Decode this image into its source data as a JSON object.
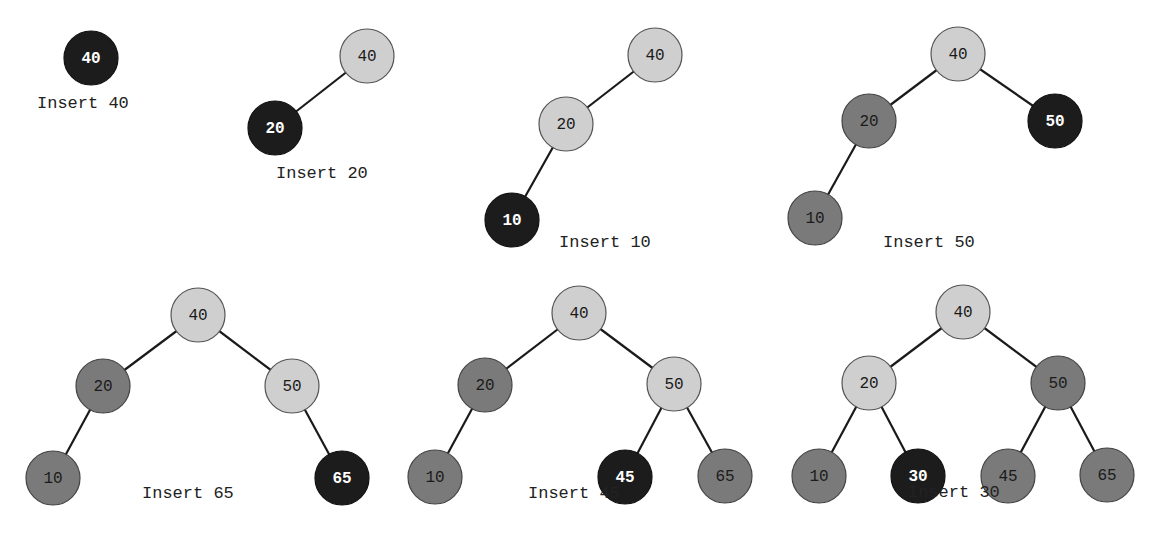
{
  "colors": {
    "new_node": "#1c1c1c",
    "balanced_node": "#cfcfcf",
    "existing_node": "#7a7a7a",
    "edge": "#1a1a1a"
  },
  "steps": [
    {
      "caption": "Insert 40",
      "caption_pos": [
        37,
        108
      ],
      "nodes": [
        {
          "v": "40",
          "x": 91,
          "y": 58,
          "s": "dark"
        }
      ],
      "edges": []
    },
    {
      "caption": "Insert 20",
      "caption_pos": [
        276,
        178
      ],
      "nodes": [
        {
          "v": "40",
          "x": 367,
          "y": 56,
          "s": "light"
        },
        {
          "v": "20",
          "x": 275,
          "y": 128,
          "s": "dark"
        }
      ],
      "edges": [
        [
          0,
          1
        ]
      ]
    },
    {
      "caption": "Insert 10",
      "caption_pos": [
        559,
        247
      ],
      "nodes": [
        {
          "v": "40",
          "x": 655,
          "y": 55,
          "s": "light"
        },
        {
          "v": "20",
          "x": 566,
          "y": 124,
          "s": "light"
        },
        {
          "v": "10",
          "x": 512,
          "y": 220,
          "s": "dark"
        }
      ],
      "edges": [
        [
          0,
          1
        ],
        [
          1,
          2
        ]
      ]
    },
    {
      "caption": "Insert 50",
      "caption_pos": [
        883,
        247
      ],
      "nodes": [
        {
          "v": "40",
          "x": 958,
          "y": 54,
          "s": "light"
        },
        {
          "v": "20",
          "x": 869,
          "y": 121,
          "s": "mid"
        },
        {
          "v": "50",
          "x": 1055,
          "y": 121,
          "s": "dark"
        },
        {
          "v": "10",
          "x": 815,
          "y": 218,
          "s": "mid"
        }
      ],
      "edges": [
        [
          0,
          1
        ],
        [
          0,
          2
        ],
        [
          1,
          3
        ]
      ]
    },
    {
      "caption": "Insert 65",
      "caption_pos": [
        142,
        498
      ],
      "nodes": [
        {
          "v": "40",
          "x": 198,
          "y": 315,
          "s": "light"
        },
        {
          "v": "20",
          "x": 103,
          "y": 386,
          "s": "mid"
        },
        {
          "v": "50",
          "x": 292,
          "y": 386,
          "s": "light"
        },
        {
          "v": "10",
          "x": 53,
          "y": 478,
          "s": "mid"
        },
        {
          "v": "65",
          "x": 342,
          "y": 478,
          "s": "dark"
        }
      ],
      "edges": [
        [
          0,
          1
        ],
        [
          0,
          2
        ],
        [
          1,
          3
        ],
        [
          2,
          4
        ]
      ]
    },
    {
      "caption": "Insert 45",
      "caption_pos": [
        528,
        498
      ],
      "nodes": [
        {
          "v": "40",
          "x": 579,
          "y": 313,
          "s": "light"
        },
        {
          "v": "20",
          "x": 485,
          "y": 385,
          "s": "mid"
        },
        {
          "v": "50",
          "x": 674,
          "y": 384,
          "s": "light"
        },
        {
          "v": "10",
          "x": 435,
          "y": 477,
          "s": "mid"
        },
        {
          "v": "45",
          "x": 625,
          "y": 477,
          "s": "dark"
        },
        {
          "v": "65",
          "x": 725,
          "y": 476,
          "s": "mid"
        }
      ],
      "edges": [
        [
          0,
          1
        ],
        [
          0,
          2
        ],
        [
          1,
          3
        ],
        [
          2,
          4
        ],
        [
          2,
          5
        ]
      ]
    },
    {
      "caption": "Insert 30",
      "caption_pos": [
        908,
        497
      ],
      "nodes": [
        {
          "v": "40",
          "x": 963,
          "y": 312,
          "s": "light"
        },
        {
          "v": "20",
          "x": 869,
          "y": 383,
          "s": "light"
        },
        {
          "v": "50",
          "x": 1058,
          "y": 383,
          "s": "mid"
        },
        {
          "v": "10",
          "x": 819,
          "y": 476,
          "s": "mid"
        },
        {
          "v": "30",
          "x": 918,
          "y": 476,
          "s": "dark"
        },
        {
          "v": "45",
          "x": 1008,
          "y": 476,
          "s": "mid"
        },
        {
          "v": "65",
          "x": 1107,
          "y": 475,
          "s": "mid"
        }
      ],
      "edges": [
        [
          0,
          1
        ],
        [
          0,
          2
        ],
        [
          1,
          3
        ],
        [
          1,
          4
        ],
        [
          2,
          5
        ],
        [
          2,
          6
        ]
      ]
    }
  ],
  "node_radius": 27
}
